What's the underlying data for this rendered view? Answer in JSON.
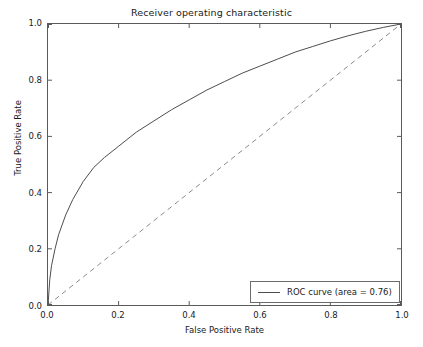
{
  "chart_data": {
    "type": "line",
    "title": "Receiver operating characteristic",
    "xlabel": "False Positive Rate",
    "ylabel": "True Positive Rate",
    "xlim": [
      0.0,
      1.0
    ],
    "ylim": [
      0.0,
      1.0
    ],
    "grid": false,
    "legend_position": "lower right",
    "xticks": [
      "0.0",
      "0.2",
      "0.4",
      "0.6",
      "0.8",
      "1.0"
    ],
    "xtick_values": [
      0.0,
      0.2,
      0.4,
      0.6,
      0.8,
      1.0
    ],
    "yticks": [
      "0.0",
      "0.2",
      "0.4",
      "0.6",
      "0.8",
      "1.0"
    ],
    "ytick_values": [
      0.0,
      0.2,
      0.4,
      0.6,
      0.8,
      1.0
    ],
    "series": [
      {
        "name": "ROC curve (area = 0.76)",
        "style": "solid",
        "color": "#4d4d4d",
        "x": [
          0.0,
          0.005,
          0.01,
          0.02,
          0.03,
          0.05,
          0.07,
          0.1,
          0.13,
          0.16,
          0.2,
          0.25,
          0.3,
          0.35,
          0.4,
          0.45,
          0.5,
          0.55,
          0.6,
          0.65,
          0.7,
          0.75,
          0.8,
          0.85,
          0.9,
          0.95,
          1.0
        ],
        "y": [
          0.0,
          0.09,
          0.14,
          0.2,
          0.25,
          0.32,
          0.375,
          0.44,
          0.49,
          0.525,
          0.565,
          0.615,
          0.655,
          0.695,
          0.73,
          0.765,
          0.795,
          0.825,
          0.85,
          0.875,
          0.9,
          0.92,
          0.94,
          0.958,
          0.974,
          0.988,
          1.0
        ]
      },
      {
        "name": "chance-diagonal",
        "style": "dashed",
        "color": "#8a8a8a",
        "x": [
          0.0,
          1.0
        ],
        "y": [
          0.0,
          1.0
        ]
      }
    ],
    "legend_entries": [
      {
        "label": "ROC curve (area = 0.76)",
        "color": "#4d4d4d",
        "style": "solid"
      }
    ],
    "annotations": {
      "area_under_curve": 0.76
    }
  }
}
